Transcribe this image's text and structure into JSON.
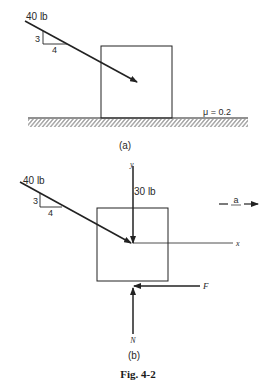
{
  "figure": {
    "caption": "Fig. 4-2",
    "ink_color": "#222222"
  },
  "panel_a": {
    "label": "(a)",
    "applied_force": {
      "label": "40 lb",
      "slope_rise": "3",
      "slope_run": "4"
    },
    "friction": {
      "label": "μ = 0.2"
    }
  },
  "panel_b": {
    "label": "(b)",
    "applied_force": {
      "label": "40 lb",
      "slope_rise": "3",
      "slope_run": "4"
    },
    "weight": {
      "label": "30 lb"
    },
    "axes": {
      "x_label": "x",
      "y_label": "y"
    },
    "acceleration": {
      "label": "a"
    },
    "friction_force": {
      "label": "F"
    },
    "normal_force": {
      "label": "N"
    }
  }
}
